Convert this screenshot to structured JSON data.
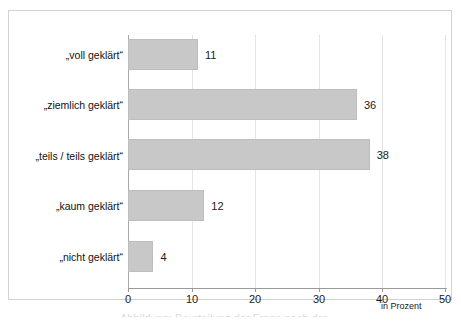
{
  "chart_data": {
    "type": "bar",
    "orientation": "horizontal",
    "title": "",
    "xlabel": "in Prozent",
    "ylabel": "",
    "categories": [
      "„voll geklärt“",
      "„ziemlich geklärt“",
      "„teils / teils geklärt“",
      "„kaum geklärt“",
      "„nicht geklärt“"
    ],
    "values": [
      11,
      36,
      38,
      12,
      4
    ],
    "value_labels": [
      "11",
      "36",
      "38",
      "12",
      "4"
    ],
    "xlim": [
      0,
      50
    ],
    "xticks": [
      0,
      10,
      20,
      30,
      40,
      50
    ],
    "xtick_labels": [
      "0",
      "10",
      "20",
      "30",
      "40",
      "50"
    ],
    "grid": "vertical",
    "legend": "none",
    "bar_color": "#c8c8c8",
    "bar_edge_color": "#bdbdbd",
    "gridline_color": "#e3e3e3",
    "axis_color": "#9a9a9a",
    "text_color": "#1a1a1a"
  },
  "caption_fragment": "Abbildung: Beurteilung der Frage nach der"
}
